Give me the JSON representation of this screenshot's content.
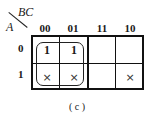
{
  "kmap": {
    "row_var": "A",
    "col_var": "BC",
    "col_headers": [
      "00",
      "01",
      "11",
      "10"
    ],
    "row_headers": [
      "0",
      "1"
    ],
    "cells": [
      [
        "1",
        "1",
        "",
        ""
      ],
      [
        "×",
        "×",
        "",
        "×"
      ]
    ],
    "groups": [
      {
        "cols": [
          "00",
          "01"
        ],
        "rows": [
          "0",
          "1"
        ]
      }
    ]
  },
  "caption": "( c )"
}
